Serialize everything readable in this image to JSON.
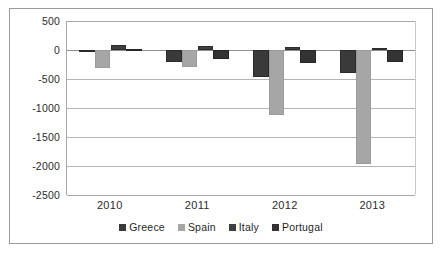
{
  "chart_data": {
    "type": "bar",
    "title": "",
    "subtitle": "",
    "xlabel": "",
    "ylabel": "",
    "categories": [
      "2010",
      "2011",
      "2012",
      "2013"
    ],
    "series": [
      {
        "name": "Greece",
        "color": "#3a3a3a",
        "values": [
          0,
          -200,
          -460,
          -400
        ]
      },
      {
        "name": "Spain",
        "color": "#a6a6a6",
        "values": [
          -310,
          -290,
          -1120,
          -1970
        ]
      },
      {
        "name": "Italy",
        "color": "#3f3f3f",
        "values": [
          80,
          70,
          50,
          30
        ]
      },
      {
        "name": "Portugal",
        "color": "#333333",
        "values": [
          10,
          -150,
          -230,
          -210
        ]
      }
    ],
    "ylim": [
      -2500,
      500
    ],
    "ytick_values": [
      500,
      0,
      -500,
      -1000,
      -1500,
      -2000,
      -2500
    ],
    "ytick_labels": [
      "500",
      "0",
      "-500",
      "-1000",
      "-1500",
      "-2000",
      "-2500"
    ],
    "grid": true,
    "legend_position": "bottom",
    "orientation": "vertical",
    "grouping": "clustered"
  },
  "legend": {
    "items": [
      {
        "label": "Greece"
      },
      {
        "label": "Spain"
      },
      {
        "label": "Italy"
      },
      {
        "label": "Portugal"
      }
    ]
  }
}
